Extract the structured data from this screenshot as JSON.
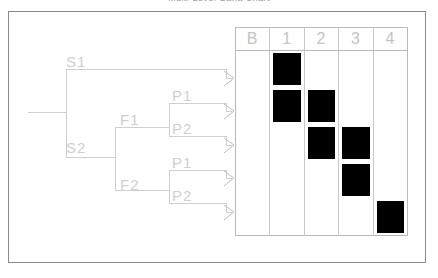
{
  "title": "Multi-Level Gantt Chart",
  "colors": {
    "frame_border": "#8a8a8a",
    "grid_line": "#c9c9c9",
    "grid_border": "#b9b9b9",
    "label_text": "#cfcfcf",
    "header_text": "#c4c4c4",
    "block_fill": "#000000",
    "tree_line": "#cfcfcf",
    "background": "#ffffff"
  },
  "tree": {
    "root": {
      "name": "root-node"
    },
    "nodes": [
      {
        "id": "s1",
        "label": "S1",
        "x": 66,
        "y": 54,
        "level": 1
      },
      {
        "id": "s2",
        "label": "S2",
        "x": 66,
        "y": 140,
        "level": 1
      },
      {
        "id": "f1",
        "label": "F1",
        "x": 120,
        "y": 112,
        "level": 2
      },
      {
        "id": "f2",
        "label": "F2",
        "x": 120,
        "y": 177,
        "level": 2
      },
      {
        "id": "p1a",
        "label": "P1",
        "x": 172,
        "y": 88,
        "level": 3
      },
      {
        "id": "p2a",
        "label": "P2",
        "x": 172,
        "y": 121,
        "level": 3
      },
      {
        "id": "p1b",
        "label": "P1",
        "x": 172,
        "y": 155,
        "level": 3
      },
      {
        "id": "p2b",
        "label": "P2",
        "x": 172,
        "y": 188,
        "level": 3
      }
    ],
    "arrows": [
      {
        "name": "arrow-row-1",
        "y": 78
      },
      {
        "name": "arrow-row-2",
        "y": 111
      },
      {
        "name": "arrow-row-3",
        "y": 145
      },
      {
        "name": "arrow-row-4",
        "y": 178
      },
      {
        "name": "arrow-row-5",
        "y": 212
      }
    ]
  },
  "matrix": {
    "headers": [
      "B",
      "1",
      "2",
      "3",
      "4"
    ],
    "row_count": 5,
    "blocks": [
      {
        "row": 1,
        "col": 1
      },
      {
        "row": 2,
        "col": 1
      },
      {
        "row": 2,
        "col": 2
      },
      {
        "row": 3,
        "col": 2
      },
      {
        "row": 3,
        "col": 3
      },
      {
        "row": 4,
        "col": 3
      },
      {
        "row": 5,
        "col": 4
      }
    ]
  },
  "chart_data": {
    "type": "table",
    "title": "Multi-Level Gantt Chart",
    "xlabel": "",
    "ylabel": "",
    "categories": [
      "B",
      "1",
      "2",
      "3",
      "4"
    ],
    "rows": [
      "S1",
      "F1 / P1",
      "F1 / P2",
      "F2 / P1",
      "F2 / P2"
    ],
    "grid": [
      [
        0,
        1,
        0,
        0,
        0
      ],
      [
        0,
        1,
        1,
        0,
        0
      ],
      [
        0,
        0,
        1,
        1,
        0
      ],
      [
        0,
        0,
        0,
        1,
        0
      ],
      [
        0,
        0,
        0,
        0,
        1
      ]
    ],
    "legend": [],
    "annotations": [
      "S1",
      "S2",
      "F1",
      "F2",
      "P1",
      "P2",
      "P1",
      "P2"
    ]
  }
}
